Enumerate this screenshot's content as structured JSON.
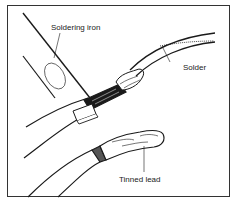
{
  "figure": {
    "labels": {
      "soldering_iron": "Soldering iron",
      "solder": "Solder",
      "tinned_lead": "Tinned lead"
    },
    "colors": {
      "ink": "#1a1a1a",
      "background": "#ffffff",
      "frame": "#333333"
    }
  }
}
